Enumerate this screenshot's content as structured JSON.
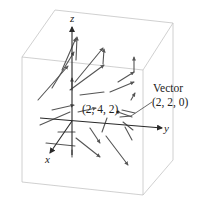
{
  "figure": {
    "type": "3d-vector-field",
    "axes": {
      "x_label": "x",
      "y_label": "y",
      "z_label": "z"
    },
    "point_annotation": {
      "label": "(2, 4, 2)",
      "coords": [
        2,
        4,
        2
      ]
    },
    "vector_annotation": {
      "title": "Vector",
      "label": "(2, 2, 0)",
      "components": [
        2,
        2,
        0
      ]
    },
    "colors": {
      "background": "#ffffff",
      "box_edges": "#c4c4c4",
      "axes": "#2a2a2a",
      "vectors": "#555555",
      "text": "#222222"
    }
  }
}
